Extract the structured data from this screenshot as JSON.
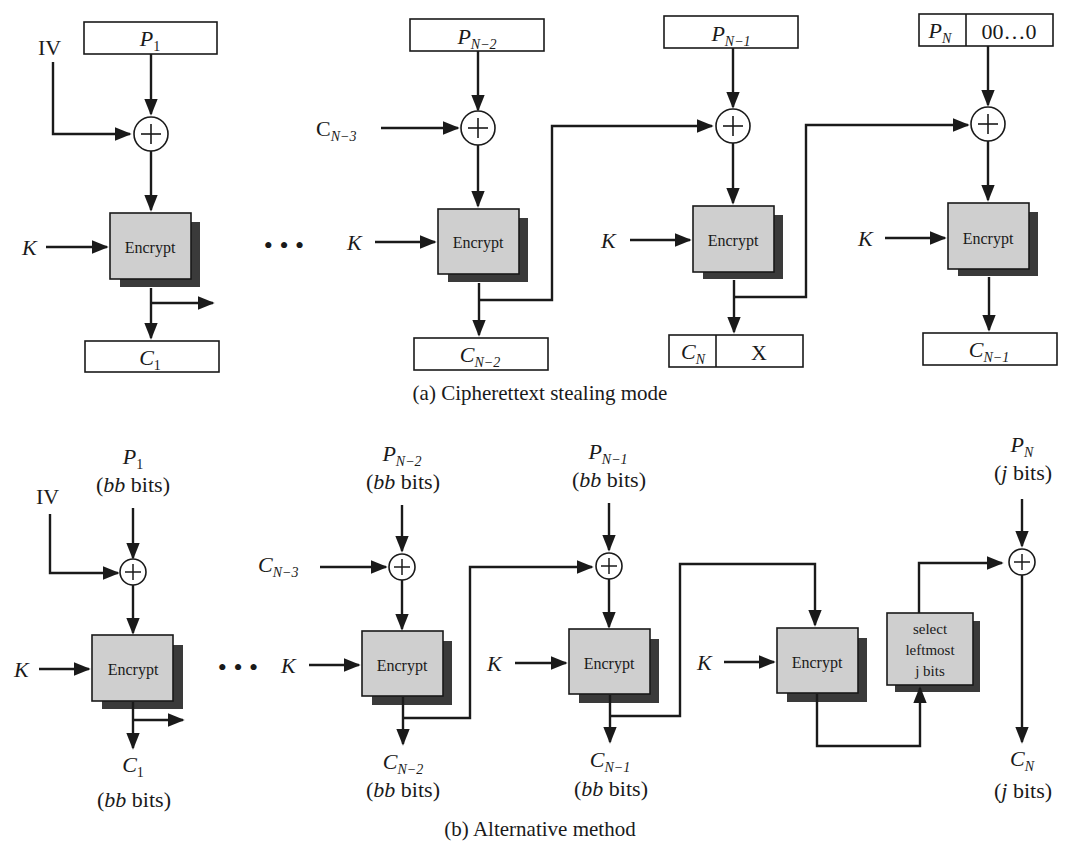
{
  "figure": {
    "panel_a": {
      "caption": "(a) Cipherettext stealing mode",
      "iv": "IV",
      "key": "K",
      "ellipsis": "• • •",
      "encrypt": "Encrypt",
      "inputs": {
        "p1": {
          "base": "P",
          "sub": "1"
        },
        "pn2": {
          "base": "P",
          "sub": "N−2"
        },
        "pn1": {
          "base": "P",
          "sub": "N−1"
        },
        "pn": {
          "base": "P",
          "sub": "N"
        },
        "pad": "00…0"
      },
      "chain_in": {
        "base": "C",
        "sub": "N−3"
      },
      "outputs": {
        "c1": {
          "base": "C",
          "sub": "1"
        },
        "cn2": {
          "base": "C",
          "sub": "N−2"
        },
        "cn": {
          "base": "C",
          "sub": "N"
        },
        "x": "X",
        "cn1": {
          "base": "C",
          "sub": "N−1"
        }
      }
    },
    "panel_b": {
      "caption": "(b) Alternative method",
      "iv": "IV",
      "key": "K",
      "ellipsis": "• • •",
      "encrypt": "Encrypt",
      "select": [
        "select",
        "leftmost",
        "j bits"
      ],
      "bb_bits": "bits",
      "bb": "bb",
      "j": "j",
      "inputs": {
        "p1": {
          "base": "P",
          "sub": "1"
        },
        "pn2": {
          "base": "P",
          "sub": "N−2"
        },
        "pn1": {
          "base": "P",
          "sub": "N−1"
        },
        "pn": {
          "base": "P",
          "sub": "N"
        }
      },
      "chain_in": {
        "base": "C",
        "sub": "N−3"
      },
      "outputs": {
        "c1": {
          "base": "C",
          "sub": "1"
        },
        "cn2": {
          "base": "C",
          "sub": "N−2"
        },
        "cn1": {
          "base": "C",
          "sub": "N−1"
        },
        "cn": {
          "base": "C",
          "sub": "N"
        }
      }
    },
    "colors": {
      "encrypt_fill": "#cfcfcf",
      "shadow": "#3a3a3a",
      "line": "#1a1a1a",
      "background": "#ffffff"
    }
  }
}
